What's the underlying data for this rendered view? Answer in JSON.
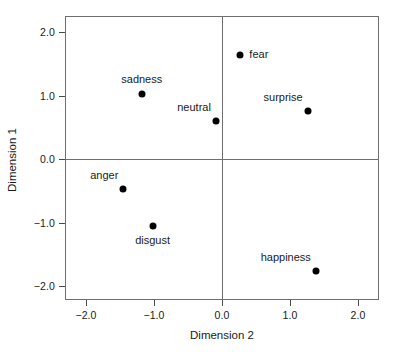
{
  "chart_data": {
    "type": "scatter",
    "title": "",
    "xlabel": "Dimension 2",
    "ylabel": "Dimension 1",
    "xlim": [
      -2.2,
      2.2
    ],
    "ylim": [
      -2.2,
      2.2
    ],
    "grid": false,
    "legend": "none",
    "reference_lines": {
      "x": 0.0,
      "y": 0.0
    },
    "xticks": [
      -2.0,
      -1.0,
      0.0,
      1.0,
      2.0
    ],
    "xticklabels": [
      "-2.0",
      "-1.0",
      "0.0",
      "1.0",
      "2.0"
    ],
    "yticks": [
      -2.0,
      -1.0,
      0.0,
      1.0,
      2.0
    ],
    "yticklabels": [
      "-2.0",
      "-1.0",
      "0.0",
      "1.0",
      "2.0"
    ],
    "points": [
      {
        "label": "fear",
        "x": 0.27,
        "y": 1.63,
        "label_pos": "right"
      },
      {
        "label": "sadness",
        "x": -1.18,
        "y": 1.02,
        "label_pos": "above"
      },
      {
        "label": "surprise",
        "x": 1.26,
        "y": 0.75,
        "label_pos": "above-left"
      },
      {
        "label": "neutral",
        "x": -0.09,
        "y": 0.6,
        "label_pos": "above-left"
      },
      {
        "label": "anger",
        "x": -1.45,
        "y": -0.48,
        "label_pos": "above-left"
      },
      {
        "label": "disgust",
        "x": -1.02,
        "y": -1.05,
        "label_pos": "below"
      },
      {
        "label": "happiness",
        "x": 1.38,
        "y": -1.77,
        "label_pos": "above-left"
      }
    ]
  },
  "axes": {
    "x_title": "Dimension 2",
    "y_title": "Dimension 1",
    "x_tick_labels": [
      "-2.0",
      "-1.0",
      "0.0",
      "1.0",
      "2.0"
    ],
    "y_tick_labels": [
      "2.0",
      "1.0",
      "0.0",
      "-1.0",
      "-2.0"
    ]
  },
  "colors": {
    "point": "#000000",
    "frame": "#6e6e6e",
    "text": "#1a1a1a",
    "background": "#ffffff"
  }
}
